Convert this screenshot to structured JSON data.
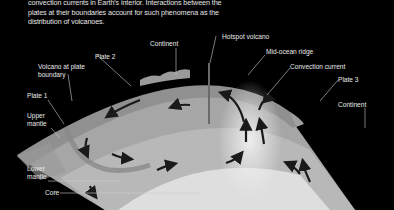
{
  "caption": {
    "text": "convection currents in Earth's interior. Interactions between the plates at their boundaries account for such phenomena as the distribution of volcanoes."
  },
  "labels": {
    "continent_left": "Continent",
    "plate_2": "Plate 2",
    "volcano_at_plate_boundary": "Volcano at plate boundary",
    "volcano_line1": "Volcano at plate",
    "volcano_line2": "boundary",
    "plate_1": "Plate 1",
    "upper_mantle_line1": "Upper",
    "upper_mantle_line2": "mantle",
    "lower_mantle_line1": "Lower",
    "lower_mantle_line2": "mantle",
    "core": "Core",
    "hotspot_volcano": "Hotspot volcano",
    "mid_ocean_ridge": "Mid-ocean ridge",
    "convection_current": "Convection current",
    "plate_3": "Plate 3",
    "continent_right": "Continent"
  },
  "colors": {
    "background": "#000000",
    "crust": "#8c8c8c",
    "upper_mantle": "#a8a8a8",
    "lower_mantle": "#bdbdbd",
    "core": "#dcdcdc",
    "plume": "#e9e9e9",
    "arrow": "#1a1a1a",
    "label_text": "#e8e8e8",
    "leader_line": "#cfcfcf"
  }
}
